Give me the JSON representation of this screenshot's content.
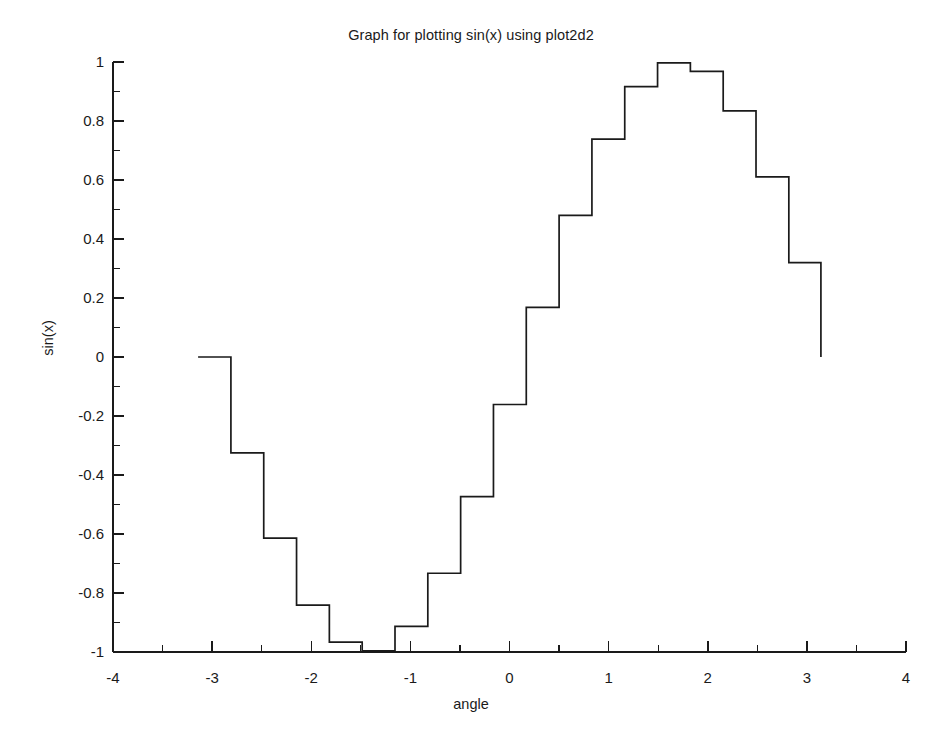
{
  "chart_data": {
    "type": "line",
    "subtype": "stairs",
    "title": "Graph for plotting sin(x) using plot2d2",
    "xlabel": "angle",
    "ylabel": "sin(x)",
    "xlim": [
      -4,
      4
    ],
    "ylim": [
      -1,
      1
    ],
    "grid": false,
    "legend": null,
    "x_ticks": [
      -4,
      -3,
      -2,
      -1,
      0,
      1,
      2,
      3,
      4
    ],
    "x_tick_labels": [
      "-4",
      "-3",
      "-2",
      "-1",
      "0",
      "1",
      "2",
      "3",
      "4"
    ],
    "x_minor_ticks": [
      -3.5,
      -2.5,
      -1.5,
      -0.5,
      0.5,
      1.5,
      2.5,
      3.5
    ],
    "y_ticks": [
      -1,
      -0.8,
      -0.6,
      -0.4,
      -0.2,
      0,
      0.2,
      0.4,
      0.6,
      0.8,
      1
    ],
    "y_tick_labels": [
      "-1",
      "-0.8",
      "-0.6",
      "-0.4",
      "-0.2",
      "0",
      "0.2",
      "0.4",
      "0.6",
      "0.8",
      "1"
    ],
    "y_minor_ticks": [
      -0.9,
      -0.7,
      -0.5,
      -0.3,
      -0.1,
      0.1,
      0.3,
      0.5,
      0.7,
      0.9
    ],
    "series": [
      {
        "name": "sin(x)",
        "color": "#1a1a1a",
        "x": [
          -3.1416,
          -2.8105,
          -2.4794,
          -2.1483,
          -1.8173,
          -1.4862,
          -1.1551,
          -0.824,
          -0.4929,
          -0.1618,
          0.1693,
          0.5004,
          0.8315,
          1.1626,
          1.4937,
          1.8247,
          2.1558,
          2.4869,
          2.818,
          3.1416
        ],
        "y": [
          0.0,
          -0.3247,
          -0.6142,
          -0.8413,
          -0.9668,
          -0.9962,
          -0.9129,
          -0.7331,
          -0.4733,
          -0.1611,
          0.1685,
          0.48,
          0.7388,
          0.9168,
          0.997,
          0.9684,
          0.834,
          0.6103,
          0.32,
          0.0
        ]
      }
    ]
  },
  "figure": {
    "background": "#ffffff",
    "foreground": "#1a1a1a"
  }
}
